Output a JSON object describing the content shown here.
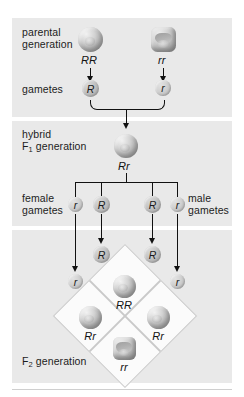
{
  "diagram": {
    "background_band_color": "#e9e9e9",
    "page_color": "#ffffff"
  },
  "rows": {
    "parental": {
      "label_line1": "parental",
      "label_line2": "generation"
    },
    "gametes": {
      "label": "gametes"
    },
    "hybrid": {
      "label_line1": "hybrid",
      "label_line2_pre": "F",
      "label_line2_sub": "1",
      "label_line2_post": " generation"
    },
    "f1_gametes": {
      "female_line1": "female",
      "female_line2": "gametes",
      "male_line1": "male",
      "male_line2": "gametes"
    },
    "f2": {
      "label_pre": "F",
      "label_sub": "2",
      "label_post": " generation"
    }
  },
  "parents": [
    {
      "genotype": "RR",
      "seed_shape": "round",
      "side": "left"
    },
    {
      "genotype": "rr",
      "seed_shape": "wrinkled",
      "side": "right"
    }
  ],
  "parental_gametes": [
    {
      "allele": "R",
      "type": "dominant"
    },
    {
      "allele": "r",
      "type": "recessive"
    }
  ],
  "hybrid": {
    "genotype": "Rr",
    "seed_shape": "round"
  },
  "f1_gamete_row": [
    {
      "allele": "r",
      "type": "recessive",
      "parent": "female"
    },
    {
      "allele": "R",
      "type": "dominant",
      "parent": "female"
    },
    {
      "allele": "R",
      "type": "dominant",
      "parent": "male"
    },
    {
      "allele": "r",
      "type": "recessive",
      "parent": "male"
    }
  ],
  "punnett_inputs": {
    "inner": [
      {
        "allele": "R",
        "type": "dominant"
      },
      {
        "allele": "R",
        "type": "dominant"
      }
    ],
    "outer": [
      {
        "allele": "r",
        "type": "recessive"
      },
      {
        "allele": "r",
        "type": "recessive"
      }
    ]
  },
  "punnett_cells": [
    {
      "position": "top",
      "genotype": "RR",
      "seed_shape": "round"
    },
    {
      "position": "left",
      "genotype": "Rr",
      "seed_shape": "round"
    },
    {
      "position": "right",
      "genotype": "Rr",
      "seed_shape": "round"
    },
    {
      "position": "bottom",
      "genotype": "rr",
      "seed_shape": "wrinkled"
    }
  ]
}
